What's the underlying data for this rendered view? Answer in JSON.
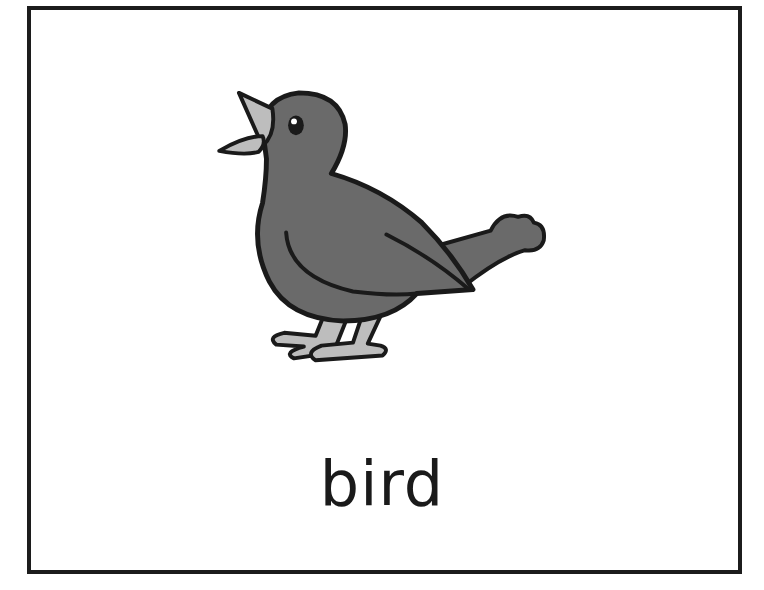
{
  "card": {
    "word": "bird",
    "image_subject": "bird-icon"
  },
  "colors": {
    "border": "#1c1c1c",
    "body": "#6a6a6a",
    "beak_legs": "#bdbdbd",
    "background": "#ffffff"
  }
}
